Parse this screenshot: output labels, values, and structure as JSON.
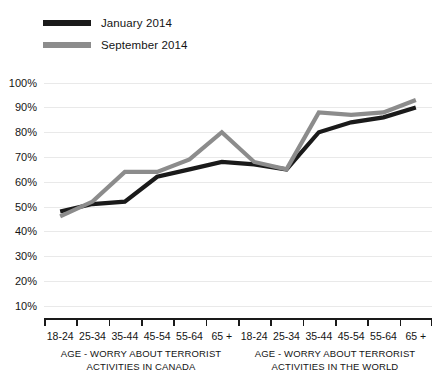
{
  "legend": {
    "items": [
      {
        "label": "January 2014",
        "color": "#1a1a1a"
      },
      {
        "label": "September 2014",
        "color": "#8c8c8c"
      }
    ]
  },
  "axis": {
    "y_ticks": [
      "10%",
      "20%",
      "30%",
      "40%",
      "50%",
      "60%",
      "70%",
      "80%",
      "90%",
      "100%"
    ],
    "x_labels": [
      "18-24",
      "25-34",
      "35-44",
      "45-54",
      "55-64",
      "65 +",
      "18-24",
      "25-34",
      "35-44",
      "45-54",
      "55-64",
      "65 +"
    ]
  },
  "groups": [
    {
      "line1": "AGE - WORRY ABOUT TERRORIST",
      "line2": "ACTIVITIES IN CANADA"
    },
    {
      "line1": "AGE - WORRY ABOUT TERRORIST",
      "line2": "ACTIVITIES IN THE WORLD"
    }
  ],
  "chart_data": {
    "type": "line",
    "title": "",
    "xlabel": "",
    "ylabel": "",
    "ylim": [
      0,
      100
    ],
    "ytick_values": [
      10,
      20,
      30,
      40,
      50,
      60,
      70,
      80,
      90,
      100
    ],
    "grid": true,
    "legend_position": "top-left",
    "categories": [
      "18-24",
      "25-34",
      "35-44",
      "45-54",
      "55-64",
      "65 +",
      "18-24",
      "25-34",
      "35-44",
      "45-54",
      "55-64",
      "65 +"
    ],
    "group_labels": [
      "AGE - WORRY ABOUT TERRORIST ACTIVITIES IN CANADA",
      "AGE - WORRY ABOUT TERRORIST ACTIVITIES IN THE WORLD"
    ],
    "series": [
      {
        "name": "January 2014",
        "color": "#1a1a1a",
        "values": [
          48,
          51,
          52,
          62,
          65,
          68,
          67,
          65,
          80,
          84,
          86,
          90
        ]
      },
      {
        "name": "September 2014",
        "color": "#8c8c8c",
        "values": [
          46,
          52,
          64,
          64,
          69,
          80,
          68,
          65,
          88,
          87,
          88,
          93
        ]
      }
    ]
  }
}
